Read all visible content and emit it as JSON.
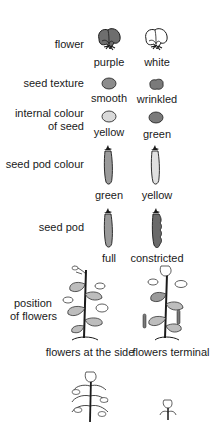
{
  "colors": {
    "ink": "#1a1a1a",
    "dark_fill": "#6e6e6e",
    "mid_fill": "#8c8c8c",
    "light_fill": "#d2d2d2",
    "leaf_fill": "#bdbdbd"
  },
  "traits": [
    {
      "label": "flower",
      "variants": [
        "purple",
        "white"
      ],
      "icon": "flower-icon"
    },
    {
      "label": "seed texture",
      "variants": [
        "smooth",
        "wrinkled"
      ],
      "icon": "seed-icon"
    },
    {
      "label_line1": "internal colour",
      "label_line2": "of seed",
      "variants": [
        "yellow",
        "green"
      ],
      "icon": "seed-icon"
    },
    {
      "label": "seed pod colour",
      "variants": [
        "green",
        "yellow"
      ],
      "icon": "pod-icon"
    },
    {
      "label": "seed pod",
      "variants": [
        "full",
        "constricted"
      ],
      "icon": "pod-icon"
    },
    {
      "label_line1": "position",
      "label_line2": "of flowers",
      "variants": [
        "flowers at the side",
        "flowers terminal"
      ],
      "icon": "plant-icon"
    },
    {
      "label": "",
      "variants": [],
      "icon": "plant-icon"
    }
  ]
}
